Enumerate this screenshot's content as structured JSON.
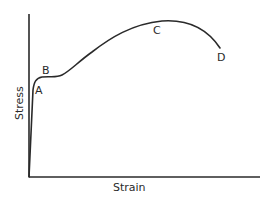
{
  "diagram": {
    "type": "stress-strain curve",
    "x_axis_label": "Strain",
    "y_axis_label": "Stress",
    "points": [
      {
        "id": "A",
        "label": "A",
        "description": "proportional / elastic limit"
      },
      {
        "id": "B",
        "label": "B",
        "description": "yield point"
      },
      {
        "id": "C",
        "label": "C",
        "description": "ultimate strength"
      },
      {
        "id": "D",
        "label": "D",
        "description": "fracture point"
      }
    ],
    "colors": {
      "line": "#2a2a2a",
      "background": "#ffffff"
    }
  }
}
